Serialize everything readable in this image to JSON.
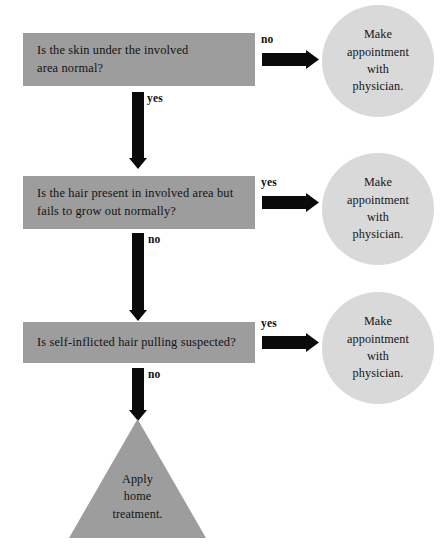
{
  "diagram": {
    "type": "flowchart",
    "colors": {
      "box_fill": "#9d9d9d",
      "circle_fill": "#d9d9d9",
      "triangle_fill": "#9d9d9d",
      "arrow": "#0a0a0a",
      "text": "#121212",
      "background": "#ffffff"
    },
    "nodes": {
      "box_1": {
        "shape": "rectangle",
        "text": "Is the skin under the involved\narea normal?"
      },
      "box_2": {
        "shape": "rectangle",
        "text": "Is the hair present in involved area but\nfails to grow out normally?"
      },
      "box_3": {
        "shape": "rectangle",
        "text": "Is self-inflicted hair pulling suspected?"
      },
      "circle_1": {
        "shape": "circle",
        "text": "Make\nappointment\nwith\nphysician."
      },
      "circle_2": {
        "shape": "circle",
        "text": "Make\nappointment\nwith\nphysician."
      },
      "circle_3": {
        "shape": "circle",
        "text": "Make\nappointment\nwith\nphysician."
      },
      "triangle": {
        "shape": "triangle",
        "text": "Apply\nhome\ntreatment."
      }
    },
    "edges": {
      "box1_to_circle1": {
        "label": "no",
        "direction": "right"
      },
      "box1_to_box2": {
        "label": "yes",
        "direction": "down"
      },
      "box2_to_circle2": {
        "label": "yes",
        "direction": "right"
      },
      "box2_to_box3": {
        "label": "no",
        "direction": "down"
      },
      "box3_to_circle3": {
        "label": "yes",
        "direction": "right"
      },
      "box3_to_triangle": {
        "label": "no",
        "direction": "down"
      }
    }
  }
}
